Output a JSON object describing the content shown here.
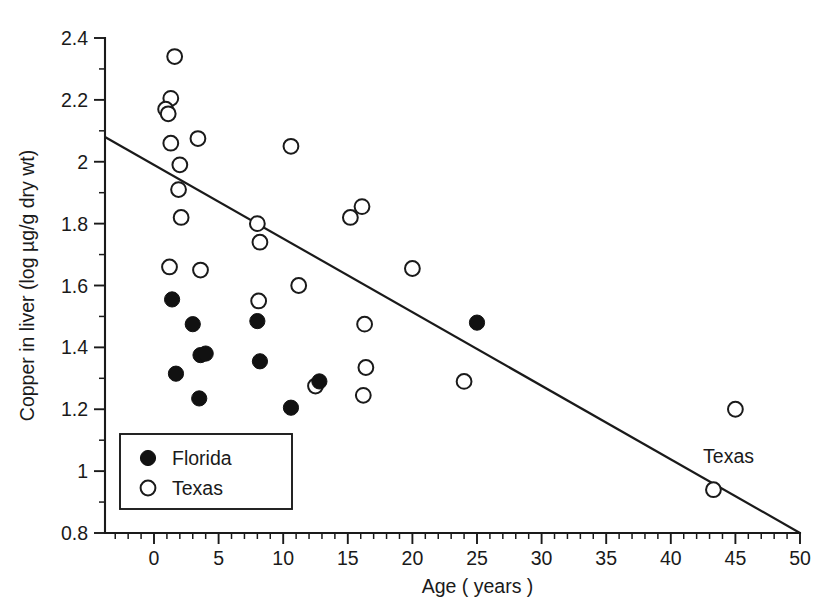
{
  "chart_data": {
    "type": "scatter",
    "title": "",
    "xlabel": "Age ( years )",
    "ylabel": "Copper in liver (log µg/g dry wt)",
    "xlim": [
      -3,
      50
    ],
    "ylim": [
      0.8,
      2.4
    ],
    "x_ticks": [
      0,
      5,
      10,
      15,
      20,
      25,
      30,
      35,
      40,
      45,
      50
    ],
    "x_tick_labels": [
      "0",
      "5",
      "10",
      "15",
      "20",
      "25",
      "30",
      "35",
      "40",
      "45",
      "50"
    ],
    "x_minor_step": 1,
    "y_ticks": [
      0.8,
      1,
      1.2,
      1.4,
      1.6,
      1.8,
      2,
      2.2,
      2.4
    ],
    "y_tick_labels": [
      "0.8",
      "1",
      "1.2",
      "1.4",
      "1.6",
      "1.8",
      "2",
      "2.2",
      "2.4"
    ],
    "y_minor_step": 0.1,
    "grid": false,
    "legend_position": "lower-left",
    "series": [
      {
        "name": "Florida",
        "marker": "filled-circle",
        "color": "#111111",
        "points": [
          [
            1.4,
            1.555
          ],
          [
            1.7,
            1.315
          ],
          [
            3.0,
            1.475
          ],
          [
            3.6,
            1.375
          ],
          [
            4.0,
            1.38
          ],
          [
            3.5,
            1.235
          ],
          [
            8.0,
            1.485
          ],
          [
            8.2,
            1.355
          ],
          [
            10.6,
            1.205
          ],
          [
            12.8,
            1.29
          ],
          [
            25.0,
            1.48
          ]
        ]
      },
      {
        "name": "Texas",
        "marker": "open-circle",
        "color": "#1a1a1a",
        "points": [
          [
            1.6,
            2.34
          ],
          [
            1.3,
            2.205
          ],
          [
            0.9,
            2.17
          ],
          [
            1.1,
            2.155
          ],
          [
            1.3,
            2.06
          ],
          [
            2.0,
            1.99
          ],
          [
            1.9,
            1.91
          ],
          [
            2.1,
            1.82
          ],
          [
            1.2,
            1.66
          ],
          [
            3.4,
            2.075
          ],
          [
            3.6,
            1.65
          ],
          [
            10.6,
            2.05
          ],
          [
            8.0,
            1.8
          ],
          [
            8.2,
            1.74
          ],
          [
            8.1,
            1.55
          ],
          [
            11.2,
            1.6
          ],
          [
            12.5,
            1.275
          ],
          [
            15.2,
            1.82
          ],
          [
            16.1,
            1.855
          ],
          [
            16.3,
            1.475
          ],
          [
            16.4,
            1.335
          ],
          [
            16.2,
            1.245
          ],
          [
            20.0,
            1.655
          ],
          [
            24.0,
            1.29
          ],
          [
            45.0,
            1.2
          ],
          [
            43.3,
            0.94
          ]
        ]
      }
    ],
    "regression_line": {
      "name": "Texas regression",
      "label": "Texas",
      "label_x": 42.5,
      "label_y": 1.025,
      "x_start": -3.8,
      "y_start": 2.08,
      "x_end": 50.0,
      "y_end": 0.8
    }
  },
  "legend": {
    "entries": [
      {
        "label": "Florida",
        "marker": "filled-circle"
      },
      {
        "label": "Texas",
        "marker": "open-circle"
      }
    ]
  },
  "colors": {
    "axis": "#1a1a1a",
    "marker_fill": "#111111",
    "background": "#ffffff"
  }
}
